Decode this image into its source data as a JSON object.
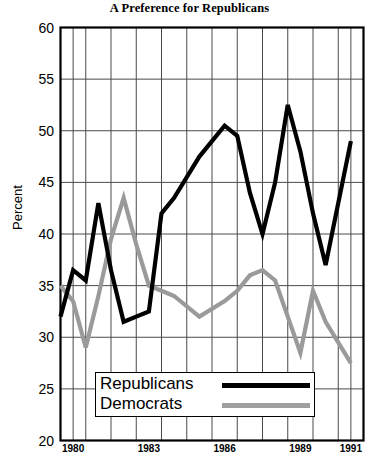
{
  "chart_data": {
    "type": "line",
    "title": "A Preference for Republicans",
    "xlabel": "",
    "ylabel": "Percent",
    "ylim": [
      20,
      60
    ],
    "ytick_step": 5,
    "yticks": [
      20,
      25,
      30,
      35,
      40,
      45,
      50,
      55,
      60
    ],
    "xlim": [
      1979.5,
      1991.5
    ],
    "xticks": [
      1980,
      1983,
      1986,
      1989,
      1991
    ],
    "xtick_labels": [
      "1980",
      "1983",
      "1986",
      "1989",
      "1991"
    ],
    "x_gridlines": [
      1980,
      1980.5,
      1981.5,
      1982.5,
      1983.5,
      1984.5,
      1985.5,
      1986.5,
      1987.5,
      1988.5,
      1989.5,
      1990.5,
      1991
    ],
    "grid": true,
    "legend_position": "bottom-left-inside",
    "x": [
      1979.5,
      1980,
      1980.5,
      1981,
      1981.5,
      1982,
      1982.5,
      1983,
      1983.5,
      1984,
      1985,
      1986,
      1986.5,
      1987,
      1987.5,
      1988,
      1988.5,
      1989,
      1989.5,
      1990,
      1991
    ],
    "series": [
      {
        "name": "Republicans",
        "color": "#000000",
        "values": [
          32.0,
          36.5,
          35.5,
          43.0,
          36.5,
          31.5,
          32.0,
          32.5,
          42.0,
          43.5,
          47.5,
          50.5,
          49.5,
          44.0,
          40.0,
          45.0,
          52.5,
          48.0,
          42.0,
          37.0,
          49.0
        ]
      },
      {
        "name": "Democrats",
        "color": "#9a9a9a",
        "values": [
          35.0,
          33.5,
          29.0,
          34.0,
          39.5,
          43.5,
          39.0,
          35.0,
          34.5,
          34.0,
          32.0,
          33.5,
          34.5,
          36.0,
          36.5,
          35.5,
          32.0,
          28.5,
          34.5,
          31.5,
          27.5
        ]
      }
    ]
  },
  "legend": {
    "entries": [
      {
        "label": "Republicans",
        "color": "#000000",
        "thickness": 5
      },
      {
        "label": "Democrats",
        "color": "#a0a0a0",
        "thickness": 5
      }
    ]
  },
  "axes": {
    "y_axis_title": "Percent",
    "y_tick_labels": [
      "60",
      "55",
      "50",
      "45",
      "40",
      "35",
      "30",
      "25",
      "20"
    ],
    "x_tick_labels": [
      "1980",
      "1983",
      "1986",
      "1989",
      "1991"
    ]
  }
}
